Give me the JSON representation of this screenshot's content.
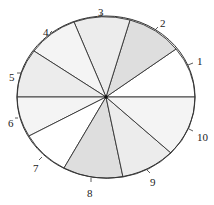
{
  "diagram": {
    "type": "spinner",
    "center": [
      106,
      97
    ],
    "rx": 89,
    "ry": 81,
    "stroke": "#333333",
    "sectors": [
      {
        "label": "1",
        "start": [
          195,
          97
        ],
        "end": [
          176,
          49
        ],
        "fill": "#ffffff",
        "label_pos": [
          197,
          61
        ],
        "tick": [
          [
            188,
            65
          ],
          [
            193,
            63
          ]
        ]
      },
      {
        "label": "2",
        "start": [
          176,
          49
        ],
        "end": [
          130,
          20
        ],
        "fill": "#dedede",
        "label_pos": [
          160,
          23
        ],
        "tick": [
          [
            155,
            30
          ],
          [
            158,
            27
          ]
        ]
      },
      {
        "label": "3",
        "start": [
          130,
          20
        ],
        "end": [
          74,
          22
        ],
        "fill": "#ececec",
        "label_pos": [
          98,
          12
        ],
        "tick": [
          [
            101,
            16
          ],
          [
            101,
            13
          ]
        ]
      },
      {
        "label": "4",
        "start": [
          74,
          22
        ],
        "end": [
          34,
          51
        ],
        "fill": "#f4f4f4",
        "label_pos": [
          43,
          32
        ],
        "tick": [
          [
            50,
            33
          ],
          [
            52,
            31
          ]
        ]
      },
      {
        "label": "5",
        "start": [
          34,
          51
        ],
        "end": [
          17,
          97
        ],
        "fill": "#ececec",
        "label_pos": [
          9,
          77
        ],
        "tick": [
          [
            17,
            73
          ],
          [
            21,
            73
          ]
        ]
      },
      {
        "label": "6",
        "start": [
          17,
          97
        ],
        "end": [
          29,
          136
        ],
        "fill": "#f4f4f4",
        "label_pos": [
          8,
          123
        ],
        "tick": [
          [
            15,
            118
          ],
          [
            18,
            118
          ]
        ]
      },
      {
        "label": "7",
        "start": [
          29,
          136
        ],
        "end": [
          64,
          168
        ],
        "fill": "#ffffff",
        "label_pos": [
          33,
          168
        ],
        "tick": [
          [
            39,
            160
          ],
          [
            42,
            157
          ]
        ]
      },
      {
        "label": "8",
        "start": [
          64,
          168
        ],
        "end": [
          123,
          177
        ],
        "fill": "#dedede",
        "label_pos": [
          87,
          193
        ],
        "tick": [
          [
            91,
            178
          ],
          [
            91,
            182
          ]
        ]
      },
      {
        "label": "9",
        "start": [
          123,
          177
        ],
        "end": [
          171,
          153
        ],
        "fill": "#ececec",
        "label_pos": [
          150,
          182
        ],
        "tick": [
          [
            147,
            170
          ],
          [
            150,
            173
          ]
        ]
      },
      {
        "label": "10",
        "start": [
          171,
          153
        ],
        "end": [
          195,
          97
        ],
        "fill": "#f4f4f4",
        "label_pos": [
          197,
          137
        ],
        "tick": [
          [
            189,
            129
          ],
          [
            193,
            131
          ]
        ]
      }
    ]
  }
}
